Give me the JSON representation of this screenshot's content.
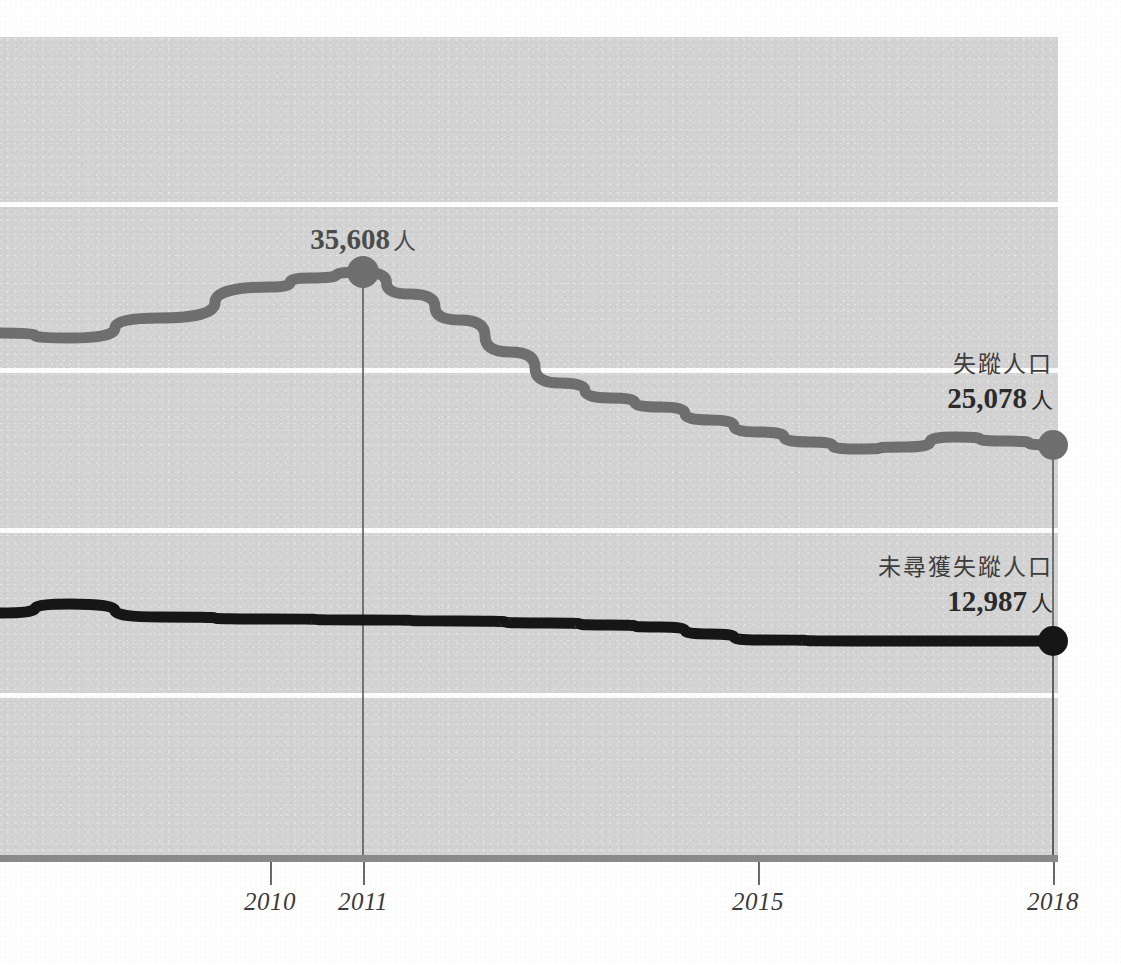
{
  "chart_data": {
    "type": "line",
    "title": "",
    "subtitle": "",
    "xlabel": "",
    "ylabel": "",
    "grid": true,
    "legend_position": "right-inline",
    "x_tick_labels": [
      "2010",
      "2011",
      "2015",
      "2018"
    ],
    "x_tick_positions_px": [
      270,
      363,
      758,
      1053
    ],
    "annotations": [
      {
        "id": "peak-2011",
        "text": "35,608",
        "unit": "人",
        "series": "失蹤人口",
        "year": "2011",
        "value": 35608,
        "x_px": 363,
        "y_px": 272
      }
    ],
    "series": [
      {
        "name": "失蹤人口",
        "color": "#6f6f6f",
        "end_label_name": "失蹤人口",
        "end_label_value": "25,078",
        "end_label_unit": "人",
        "end_value": 25078,
        "points_px": [
          [
            0,
            333
          ],
          [
            70,
            338
          ],
          [
            160,
            318
          ],
          [
            270,
            287
          ],
          [
            310,
            278
          ],
          [
            363,
            272
          ],
          [
            410,
            294
          ],
          [
            460,
            320
          ],
          [
            510,
            352
          ],
          [
            560,
            383
          ],
          [
            610,
            398
          ],
          [
            660,
            407
          ],
          [
            710,
            420
          ],
          [
            758,
            432
          ],
          [
            810,
            442
          ],
          [
            855,
            449
          ],
          [
            905,
            447
          ],
          [
            955,
            437
          ],
          [
            1005,
            441
          ],
          [
            1053,
            445
          ]
        ]
      },
      {
        "name": "未尋獲失蹤人口",
        "color": "#161616",
        "end_label_name": "未尋獲失蹤人口",
        "end_label_value": "12,987",
        "end_label_unit": "人",
        "end_value": 12987,
        "points_px": [
          [
            0,
            613
          ],
          [
            70,
            604
          ],
          [
            160,
            617
          ],
          [
            270,
            619
          ],
          [
            363,
            620
          ],
          [
            460,
            621
          ],
          [
            550,
            623
          ],
          [
            610,
            625
          ],
          [
            660,
            627
          ],
          [
            710,
            634
          ],
          [
            758,
            640
          ],
          [
            855,
            641
          ],
          [
            955,
            641
          ],
          [
            1053,
            641
          ]
        ]
      }
    ],
    "gridline_y_px": [
      204,
      370,
      530,
      695
    ],
    "axis_y_px": 855,
    "plot_area_px": {
      "left": 0,
      "top": 37,
      "right": 1058,
      "bottom": 855
    },
    "colors": {
      "panel_background": "#d3d3d3",
      "gridline": "#fdfdfd",
      "axis": "#8a8a8a",
      "series_grey": "#6f6f6f",
      "series_black": "#161616",
      "label_text": "#3d3d3d",
      "annotation_text": "#4c4c4c"
    }
  },
  "axis": {
    "ticks": [
      {
        "label": "2010",
        "x": 270
      },
      {
        "label": "2011",
        "x": 363
      },
      {
        "label": "2015",
        "x": 758
      },
      {
        "label": "2018",
        "x": 1053
      }
    ]
  },
  "annotation": {
    "peak_value": "35,608",
    "peak_unit": "人"
  },
  "labels": {
    "grey": {
      "name": "失蹤人口",
      "value": "25,078",
      "unit": "人"
    },
    "black": {
      "name": "未尋獲失蹤人口",
      "value": "12,987",
      "unit": "人"
    }
  }
}
